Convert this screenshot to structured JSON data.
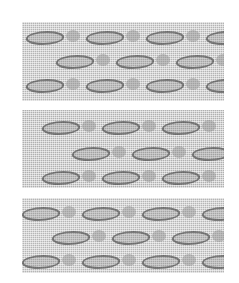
{
  "image": {
    "description": "Scanned photograph of three rectangular woven textile swatches stacked vertically, each with a fine grid weave and rows of darker wavy leaf/diamond motifs.",
    "background": "#ffffff",
    "swatches": [
      {
        "name": "swatch-top",
        "top": 22,
        "height": 79,
        "tone": "#b4b4b4",
        "motif_rows": [
          8,
          32,
          56
        ],
        "motif_offsets": [
          4,
          64,
          124,
          184
        ]
      },
      {
        "name": "swatch-middle",
        "top": 110,
        "height": 78,
        "tone": "#b0b0b0",
        "motif_rows": [
          10,
          36,
          60
        ],
        "motif_offsets": [
          20,
          80,
          140
        ]
      },
      {
        "name": "swatch-bottom",
        "top": 198,
        "height": 75,
        "tone": "#b6b6b6",
        "motif_rows": [
          8,
          32,
          56
        ],
        "motif_offsets": [
          0,
          60,
          120,
          180
        ]
      }
    ]
  }
}
